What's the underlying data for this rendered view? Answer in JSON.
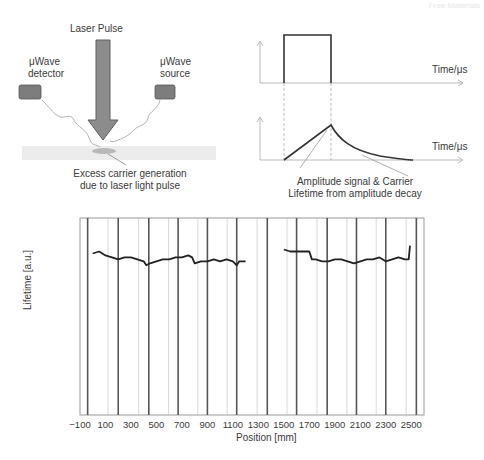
{
  "watermark": "Free Materials",
  "setup": {
    "laser_label": "Laser Pulse",
    "detector_label_line1": "μWave",
    "detector_label_line2": "detector",
    "source_label_line1": "μWave",
    "source_label_line2": "source",
    "generation_caption_line1": "Excess carrier generation",
    "generation_caption_line2": "due to laser light pulse"
  },
  "pulse_diagram": {
    "top_axis_label": "Time/μs",
    "bottom_axis_label": "Time/μs",
    "caption_line1": "Amplitude signal & Carrier",
    "caption_line2": "Lifetime from amplitude decay"
  },
  "chart_data": {
    "type": "line",
    "title": "",
    "xlabel": "Position [mm]",
    "ylabel": "Lifetime [a.u.]",
    "xlim": [
      -100,
      2600
    ],
    "x_ticks": [
      -100,
      100,
      300,
      500,
      700,
      900,
      1100,
      1300,
      1500,
      1700,
      1900,
      2100,
      2300,
      2500
    ],
    "y_ticks": [],
    "grid": "vertical lines (dark at segment boundaries, light in between)",
    "series": [
      {
        "name": "Lifetime trace segment 1",
        "x": [
          0,
          50,
          100,
          150,
          200,
          250,
          300,
          350,
          400,
          420,
          450,
          500,
          550,
          600,
          650,
          700,
          750,
          780,
          800,
          850,
          900,
          950,
          1000,
          1050,
          1100,
          1130,
          1150,
          1200
        ],
        "y": [
          0.82,
          0.83,
          0.81,
          0.8,
          0.79,
          0.8,
          0.8,
          0.79,
          0.78,
          0.76,
          0.77,
          0.78,
          0.79,
          0.79,
          0.8,
          0.8,
          0.81,
          0.8,
          0.77,
          0.78,
          0.78,
          0.79,
          0.78,
          0.79,
          0.78,
          0.76,
          0.78,
          0.78
        ]
      },
      {
        "name": "Lifetime trace segment 2",
        "x": [
          1500,
          1550,
          1600,
          1650,
          1700,
          1720,
          1750,
          1800,
          1850,
          1900,
          1950,
          2000,
          2050,
          2100,
          2150,
          2200,
          2250,
          2300,
          2350,
          2400,
          2450,
          2480,
          2490
        ],
        "y": [
          0.84,
          0.83,
          0.83,
          0.83,
          0.83,
          0.79,
          0.79,
          0.78,
          0.78,
          0.79,
          0.79,
          0.78,
          0.77,
          0.78,
          0.79,
          0.79,
          0.8,
          0.78,
          0.79,
          0.8,
          0.79,
          0.79,
          0.86
        ]
      }
    ],
    "ylim": [
      0,
      1
    ],
    "dark_vertical_lines": [
      -40,
      200,
      440,
      670,
      900,
      1130,
      1370,
      1600,
      1840,
      2070,
      2300,
      2540
    ],
    "legend": "none"
  },
  "layout": {
    "colors": {
      "arrow_fill": "#8a8a8a",
      "arrow_stroke": "#5a5a5a",
      "box_fill": "#7d7d7d",
      "wafer_fill": "#ececec",
      "spot_fill": "#b5b5b5",
      "trace": "#222222",
      "grid_dark": "#555555",
      "grid_light": "#cfcfcf",
      "axis": "#9a9a9a"
    }
  }
}
